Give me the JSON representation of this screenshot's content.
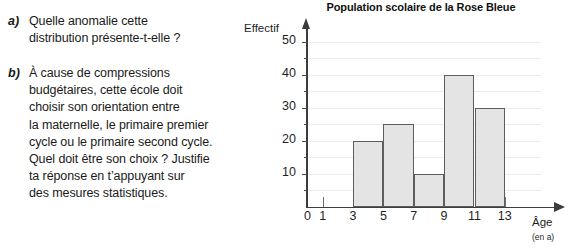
{
  "questions": [
    {
      "marker": "a)",
      "text": "Quelle anomalie cette\ndistribution présente-t-elle ?"
    },
    {
      "marker": "b)",
      "text": "À cause de compressions\nbudgétaires, cette école doit\nchoisir son orientation entre\nla maternelle, le primaire premier\ncycle ou le primaire second cycle.\nQuel doit être son choix ? Justifie\nta réponse en t’appuyant sur\ndes mesures statistiques."
    }
  ],
  "chart_data": {
    "type": "bar",
    "title": "Population scolaire de la Rose Bleue",
    "xlabel": "Âge",
    "xlabel_unit": "(en a)",
    "ylabel": "Effectif",
    "xlim": [
      0,
      14.5
    ],
    "ylim": [
      0,
      53
    ],
    "grid": true,
    "legend": null,
    "x_ticks": [
      "0",
      "1",
      "3",
      "5",
      "7",
      "9",
      "11",
      "13"
    ],
    "x_tick_values": [
      0,
      1,
      3,
      5,
      7,
      9,
      11,
      13
    ],
    "y_ticks": [
      "10",
      "20",
      "30",
      "40",
      "50"
    ],
    "y_tick_values": [
      10,
      20,
      30,
      40,
      50
    ],
    "y_minor_step": 5,
    "bin_edges": [
      3,
      5,
      7,
      9,
      11,
      13
    ],
    "categories": [
      "[3, 5[",
      "[5, 7[",
      "[7, 9[",
      "[9, 11[",
      "[11, 13["
    ],
    "values": [
      20,
      25,
      10,
      40,
      30
    ],
    "bar_fill": "#e4e4e4",
    "bar_stroke": "#5d5d5d",
    "axis_color": "#3d3d3d",
    "grid_color": "#ececec"
  }
}
